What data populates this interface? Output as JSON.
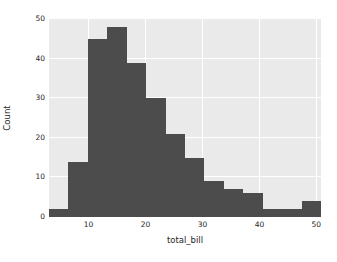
{
  "chart_data": {
    "type": "bar",
    "title": "",
    "subtitle": "",
    "xlabel": "total_bill",
    "ylabel": "Count",
    "xlim": [
      3.07,
      50.81
    ],
    "ylim": [
      0,
      50
    ],
    "grid": true,
    "legend": null,
    "bin_width": 3.41,
    "bin_edges": [
      3.07,
      6.48,
      9.89,
      13.3,
      16.71,
      20.12,
      23.53,
      26.94,
      30.35,
      33.76,
      37.17,
      40.58,
      43.99,
      47.4,
      50.81
    ],
    "categories": [
      "3.07-6.48",
      "6.48-9.89",
      "9.89-13.30",
      "13.30-16.71",
      "16.71-20.12",
      "20.12-23.53",
      "23.53-26.94",
      "26.94-30.35",
      "30.35-33.76",
      "33.76-37.17",
      "37.17-40.58",
      "40.58-43.99",
      "43.99-47.40",
      "47.40-50.81"
    ],
    "values": [
      2,
      14,
      45,
      48,
      39,
      30,
      21,
      15,
      9,
      7,
      6,
      2,
      2,
      4
    ],
    "xticks": [
      10,
      20,
      30,
      40,
      50
    ],
    "xtick_labels": [
      "10",
      "20",
      "30",
      "40",
      "50"
    ],
    "yticks": [
      0,
      10,
      20,
      30,
      40,
      50
    ],
    "ytick_labels": [
      "0",
      "10",
      "20",
      "30",
      "40",
      "50"
    ],
    "colors": {
      "bar": "#4c4c4c",
      "axes_background": "#eaeaea",
      "figure_background": "#ffffff",
      "grid": "#ffffff",
      "text": "#262626"
    }
  }
}
